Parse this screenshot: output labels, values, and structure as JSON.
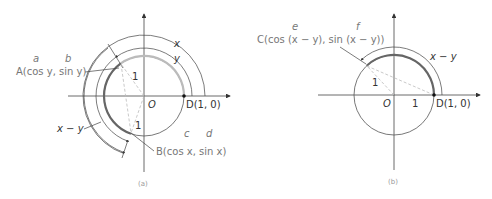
{
  "figure_a": {
    "caption": "(a)",
    "origin_label": "O",
    "point_A": "A(cos y, sin y)",
    "point_B": "B(cos x, sin x)",
    "point_D": "D(1, 0)",
    "radius_label_A": "1",
    "radius_label_B": "1",
    "arc_x_label": "x",
    "arc_y_label": "y",
    "arc_xy_label": "x − y",
    "annot_a": "a",
    "annot_b": "b",
    "annot_c": "c",
    "annot_d": "d"
  },
  "figure_b": {
    "caption": "(b)",
    "origin_label": "O",
    "point_C": "C(cos (x − y), sin (x − y))",
    "point_D": "D(1, 0)",
    "radius_label_C": "1",
    "radius_label_D": "1",
    "arc_xy_label": "x − y",
    "annot_e": "e",
    "annot_f": "f"
  },
  "colors": {
    "axis": "#444444",
    "circle": "#555555",
    "arc_highlight_light": "#bbbbbb",
    "arc_highlight_dark": "#666666",
    "label": "#777777",
    "dashed": "#bbbbbb"
  }
}
